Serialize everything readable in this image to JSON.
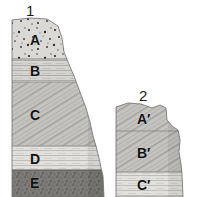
{
  "figure": {
    "title": "",
    "background_color": "#ffffff",
    "width": 201,
    "height": 197
  },
  "columns": [
    {
      "id": "column-1",
      "number_label": "1",
      "label_position": {
        "x": 26,
        "y": 3
      },
      "layers": [
        {
          "code": "A",
          "label_position": {
            "x": 30,
            "y": 33
          },
          "texture": "coarse-speckle-conglomerate",
          "fill_color": "#d8d6d2",
          "speck_color": "#2b2b2b",
          "top": 20,
          "bottom": 59
        },
        {
          "code": "B",
          "label_position": {
            "x": 30,
            "y": 64
          },
          "texture": "horizontal-lines-siltstone",
          "fill_color": "#c9c7c3",
          "line_color": "#a8a6a2",
          "top": 59,
          "bottom": 82
        },
        {
          "code": "C",
          "label_position": {
            "x": 30,
            "y": 108
          },
          "texture": "diagonal-hatch-crossbed",
          "fill_color": "#c2c0bc",
          "line_color": "#9b9995",
          "top": 82,
          "bottom": 146
        },
        {
          "code": "D",
          "label_position": {
            "x": 30,
            "y": 152
          },
          "texture": "horizontal-lines-light",
          "fill_color": "#dedcd8",
          "line_color": "#b6b4b0",
          "top": 146,
          "bottom": 170
        },
        {
          "code": "E",
          "label_position": {
            "x": 30,
            "y": 176
          },
          "texture": "fine-speckle-dark-shale",
          "fill_color": "#7a7874",
          "speck_color": "#3d3b38",
          "top": 170,
          "bottom": 197
        }
      ]
    },
    {
      "id": "column-2",
      "number_label": "2",
      "label_position": {
        "x": 139,
        "y": 88
      },
      "layers": [
        {
          "code": "A′",
          "label_position": {
            "x": 137,
            "y": 112
          },
          "texture": "diagonal-hatch-crossbed",
          "fill_color": "#c5c3bf",
          "line_color": "#9b9995",
          "top": 105,
          "bottom": 131
        },
        {
          "code": "B′",
          "label_position": {
            "x": 137,
            "y": 146
          },
          "texture": "diagonal-hatch-crossbed",
          "fill_color": "#c2c0bc",
          "line_color": "#9b9995",
          "top": 131,
          "bottom": 172
        },
        {
          "code": "C′",
          "label_position": {
            "x": 137,
            "y": 178
          },
          "texture": "horizontal-lines-light",
          "fill_color": "#dedcd8",
          "line_color": "#b6b4b0",
          "top": 172,
          "bottom": 197
        }
      ]
    }
  ]
}
